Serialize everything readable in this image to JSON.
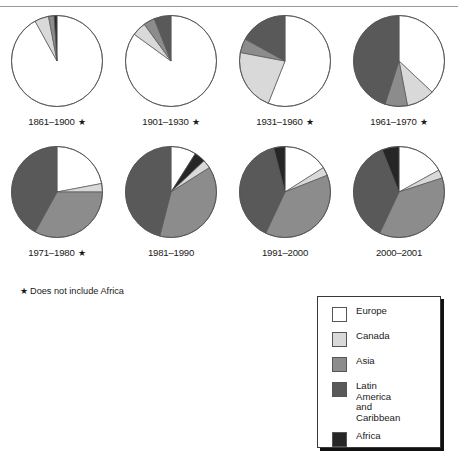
{
  "figure": {
    "footnote": "Does not include Africa",
    "footnote_star": "★",
    "star_marker": "★"
  },
  "colors": {
    "europe": "#ffffff",
    "canada": "#d9d9d9",
    "asia": "#8c8c8c",
    "latin_america_caribbean": "#595959",
    "africa": "#262626",
    "outline": "#555555",
    "text": "#1a1a1a",
    "rule": "#9a9a9a"
  },
  "legend": {
    "items": [
      {
        "label": "Europe",
        "lines": [
          "Europe"
        ],
        "color_key": "europe"
      },
      {
        "label": "Canada",
        "lines": [
          "Canada"
        ],
        "color_key": "canada"
      },
      {
        "label": "Asia",
        "lines": [
          "Asia"
        ],
        "color_key": "asia"
      },
      {
        "label": "Latin America and Caribbean",
        "lines": [
          "Latin",
          "America",
          "and",
          "Caribbean"
        ],
        "color_key": "latin_america_caribbean"
      },
      {
        "label": "Africa",
        "lines": [
          "Africa"
        ],
        "color_key": "africa"
      }
    ]
  },
  "chart_data": {
    "type": "pie",
    "title": "",
    "xlabel": "",
    "ylabel": "",
    "legend_position": "bottom-right",
    "grid": false,
    "note": "Share of immigrants by region of origin, by period. Periods marked with a star do not include Africa.",
    "categories": [
      "Europe",
      "Canada",
      "Asia",
      "Latin America and Caribbean",
      "Africa"
    ],
    "charts": [
      {
        "label": "1861–1900",
        "starred": true,
        "values": [
          92,
          5,
          2,
          0,
          1
        ],
        "slices": [
          {
            "name": "Europe",
            "value": 92
          },
          {
            "name": "Canada",
            "value": 5
          },
          {
            "name": "Asia",
            "value": 2
          },
          {
            "name": "Latin America and Caribbean",
            "value": 0
          },
          {
            "name": "Africa",
            "value": 1
          }
        ]
      },
      {
        "label": "1901–1930",
        "starred": true,
        "values": [
          85,
          5,
          4,
          6,
          0
        ],
        "slices": [
          {
            "name": "Europe",
            "value": 85
          },
          {
            "name": "Canada",
            "value": 5
          },
          {
            "name": "Asia",
            "value": 4
          },
          {
            "name": "Latin America and Caribbean",
            "value": 6
          },
          {
            "name": "Africa",
            "value": 0
          }
        ]
      },
      {
        "label": "1931–1960",
        "starred": true,
        "values": [
          56,
          22,
          5,
          17,
          0
        ],
        "slices": [
          {
            "name": "Europe",
            "value": 56
          },
          {
            "name": "Canada",
            "value": 22
          },
          {
            "name": "Asia",
            "value": 5
          },
          {
            "name": "Latin America and Caribbean",
            "value": 17
          },
          {
            "name": "Africa",
            "value": 0
          }
        ]
      },
      {
        "label": "1961–1970",
        "starred": true,
        "values": [
          37,
          10,
          8,
          45,
          0
        ],
        "slices": [
          {
            "name": "Europe",
            "value": 37
          },
          {
            "name": "Canada",
            "value": 10
          },
          {
            "name": "Asia",
            "value": 8
          },
          {
            "name": "Latin America and Caribbean",
            "value": 45
          },
          {
            "name": "Africa",
            "value": 0
          }
        ]
      },
      {
        "label": "1971–1980",
        "starred": true,
        "values": [
          22,
          3,
          33,
          42,
          0
        ],
        "slices": [
          {
            "name": "Europe",
            "value": 22
          },
          {
            "name": "Canada",
            "value": 3
          },
          {
            "name": "Asia",
            "value": 33
          },
          {
            "name": "Latin America and Caribbean",
            "value": 42
          },
          {
            "name": "Africa",
            "value": 0
          }
        ]
      },
      {
        "label": "1981–1990",
        "starred": false,
        "values": [
          9,
          3,
          38,
          46,
          4
        ],
        "slices": [
          {
            "name": "Europe",
            "value": 9
          },
          {
            "name": "Africa",
            "value": 4
          },
          {
            "name": "Canada",
            "value": 3
          },
          {
            "name": "Asia",
            "value": 38
          },
          {
            "name": "Latin America and Caribbean",
            "value": 46
          }
        ]
      },
      {
        "label": "1991–2000",
        "starred": false,
        "values": [
          16,
          3,
          38,
          39,
          4
        ],
        "slices": [
          {
            "name": "Europe",
            "value": 16
          },
          {
            "name": "Canada",
            "value": 3
          },
          {
            "name": "Asia",
            "value": 38
          },
          {
            "name": "Latin America and Caribbean",
            "value": 39
          },
          {
            "name": "Africa",
            "value": 4
          }
        ]
      },
      {
        "label": "2000–2001",
        "starred": false,
        "values": [
          17,
          3,
          37,
          37,
          6
        ],
        "slices": [
          {
            "name": "Europe",
            "value": 17
          },
          {
            "name": "Canada",
            "value": 3
          },
          {
            "name": "Asia",
            "value": 37
          },
          {
            "name": "Latin America and Caribbean",
            "value": 37
          },
          {
            "name": "Africa",
            "value": 6
          }
        ]
      }
    ]
  }
}
